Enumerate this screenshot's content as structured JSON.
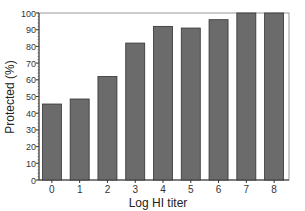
{
  "chart_data": {
    "type": "bar",
    "title": "",
    "xlabel": "Log HI titer",
    "ylabel": "Protected (%)",
    "categories": [
      "0",
      "1",
      "2",
      "3",
      "4",
      "5",
      "6",
      "7",
      "8"
    ],
    "values": [
      45.5,
      48.5,
      62,
      82,
      92,
      91,
      96,
      100,
      100
    ],
    "ylim": [
      0,
      100
    ],
    "yticks": [
      0,
      10,
      20,
      30,
      40,
      50,
      60,
      70,
      80,
      90,
      100
    ],
    "grid": false,
    "legend": null,
    "bar_color": "#6b6b6b",
    "edge_color": "#333333"
  }
}
